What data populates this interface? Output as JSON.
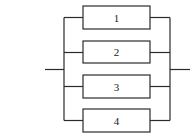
{
  "diagram": {
    "type": "parallel-system",
    "components": [
      {
        "id": "1",
        "label": "1"
      },
      {
        "id": "2",
        "label": "2"
      },
      {
        "id": "3",
        "label": "3"
      },
      {
        "id": "4",
        "label": "4"
      }
    ],
    "colors": {
      "line": "#2b2b2b",
      "background": "#ffffff"
    }
  }
}
